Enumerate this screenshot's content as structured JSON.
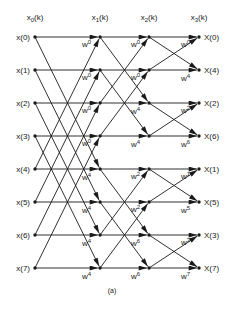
{
  "figure": {
    "caption": "(a)",
    "columns": [
      {
        "id": "x0",
        "header_base": "x",
        "header_sub": "0",
        "header_arg": "(k)",
        "x": 35
      },
      {
        "id": "x1",
        "header_base": "x",
        "header_sub": "1",
        "header_arg": "(k)",
        "x": 100
      },
      {
        "id": "x2",
        "header_base": "x",
        "header_sub": "2",
        "header_arg": "(k)",
        "x": 149
      },
      {
        "id": "x3",
        "header_base": "x",
        "header_sub": "3",
        "header_arg": "(k)",
        "x": 199
      }
    ],
    "row_y": [
      37,
      70,
      103,
      136,
      169,
      202,
      235,
      268
    ],
    "inputs": [
      "x(0)",
      "x(1)",
      "x(2)",
      "x(3)",
      "x(4)",
      "x(5)",
      "x(6)",
      "x(7)"
    ],
    "outputs": [
      "X(0)",
      "X(4)",
      "X(2)",
      "X(6)",
      "X(1)",
      "X(5)",
      "X(3)",
      "X(7)"
    ],
    "stages": [
      {
        "span": 4,
        "weights": [
          "0",
          "0",
          "0",
          "0",
          "4",
          "4",
          "4",
          "4"
        ]
      },
      {
        "span": 2,
        "weights": [
          "0",
          "0",
          "4",
          "4",
          "2",
          "2",
          "6",
          "6"
        ]
      },
      {
        "span": 1,
        "weights": [
          "0",
          "4",
          "2",
          "6",
          "1",
          "5",
          "3",
          "7"
        ]
      }
    ],
    "weight_symbol": "w"
  }
}
